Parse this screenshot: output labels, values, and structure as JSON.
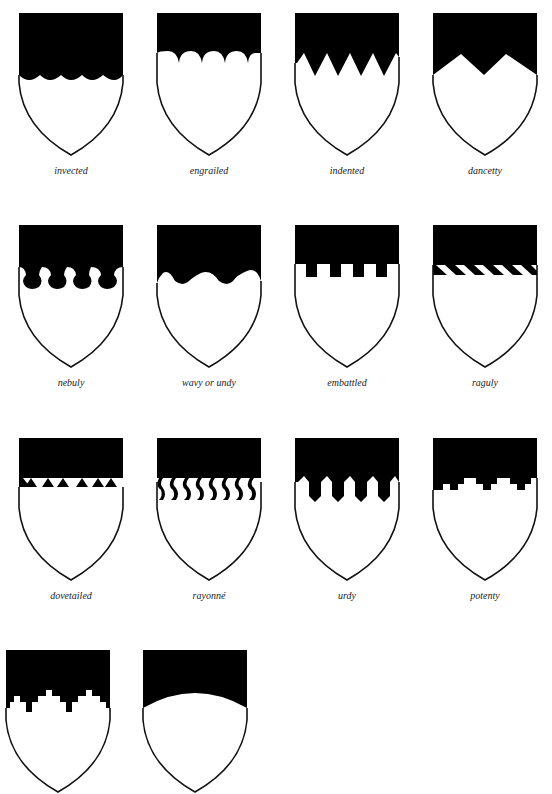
{
  "colors": {
    "field": "#ffffff",
    "chief": "#000000",
    "outline": "#111111",
    "label": "#222222"
  },
  "shields": [
    {
      "label": "invected",
      "line": "invected"
    },
    {
      "label": "engrailed",
      "line": "engrailed"
    },
    {
      "label": "indented",
      "line": "indented"
    },
    {
      "label": "dancetty",
      "line": "dancetty"
    },
    {
      "label": "nebuly",
      "line": "nebuly"
    },
    {
      "label": "wavy or undy",
      "line": "wavy"
    },
    {
      "label": "embattled",
      "line": "embattled"
    },
    {
      "label": "raguly",
      "line": "raguly"
    },
    {
      "label": "dovetailed",
      "line": "dovetailed"
    },
    {
      "label": "rayonné",
      "line": "rayonne"
    },
    {
      "label": "urdy",
      "line": "urdy"
    },
    {
      "label": "potenty",
      "line": "potenty"
    },
    {
      "label": "",
      "line": "embattled-grady"
    },
    {
      "label": "",
      "line": "arched"
    }
  ]
}
